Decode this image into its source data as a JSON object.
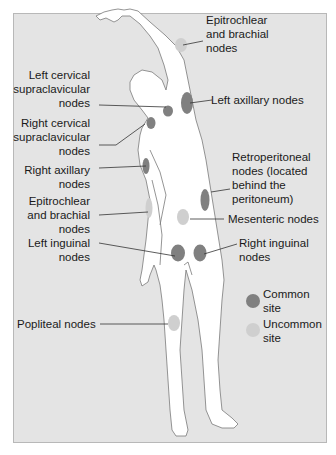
{
  "labels": {
    "epitrochlear_left": "Epitrochlear\nand brachial\nnodes",
    "left_cervical": "Left cervical\nsupraclavicular\nnodes",
    "left_axillary": "Left axillary nodes",
    "right_cervical": "Right cervical\nsupraclavicular\nnodes",
    "right_axillary": "Right axillary\nnodes",
    "retroperitoneal": "Retroperitoneal\nnodes (located\nbehind the\nperitoneum)",
    "epitrochlear_right": "Epitrochlear\nand brachial\nnodes",
    "mesenteric": "Mesenteric nodes",
    "left_inguinal": "Left inguinal\nnodes",
    "right_inguinal": "Right inguinal\nnodes",
    "popliteal": "Popliteal nodes"
  },
  "legend": {
    "common": "Common\nsite",
    "uncommon": "Uncommon\nsite"
  },
  "colors": {
    "background": "#e4e4e4",
    "body": "#ffffff",
    "common": "#808080",
    "uncommon": "#cfcfcf",
    "leader": "#333333"
  }
}
